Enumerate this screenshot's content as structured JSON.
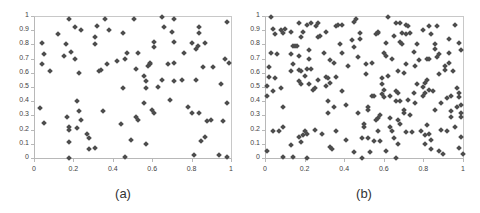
{
  "chart_data": [
    {
      "type": "scatter",
      "title": "",
      "caption": "(a)",
      "xlabel": "",
      "ylabel": "",
      "xlim": [
        0,
        1
      ],
      "ylim": [
        0,
        1
      ],
      "grid": false,
      "legend": null,
      "x_ticks": [
        "0",
        "0.2",
        "0.4",
        "0.6",
        "0.8",
        "1"
      ],
      "y_ticks": [
        "0",
        "0.1",
        "0.2",
        "0.3",
        "0.4",
        "0.5",
        "0.6",
        "0.7",
        "0.8",
        "0.9",
        "1"
      ],
      "marker": {
        "shape": "diamond",
        "color": "#4d4d4d"
      },
      "points": [
        [
          0.04,
          0.81
        ],
        [
          0.05,
          0.73
        ],
        [
          0.04,
          0.66
        ],
        [
          0.08,
          0.61
        ],
        [
          0.03,
          0.35
        ],
        [
          0.05,
          0.25
        ],
        [
          0.12,
          0.87
        ],
        [
          0.15,
          0.72
        ],
        [
          0.16,
          0.8
        ],
        [
          0.18,
          0.98
        ],
        [
          0.19,
          0.75
        ],
        [
          0.21,
          0.7
        ],
        [
          0.21,
          0.92
        ],
        [
          0.23,
          0.6
        ],
        [
          0.24,
          0.9
        ],
        [
          0.17,
          0.29
        ],
        [
          0.18,
          0.22
        ],
        [
          0.18,
          0.2
        ],
        [
          0.18,
          0.11
        ],
        [
          0.18,
          0.0
        ],
        [
          0.22,
          0.4
        ],
        [
          0.23,
          0.33
        ],
        [
          0.22,
          0.21
        ],
        [
          0.24,
          0.27
        ],
        [
          0.27,
          0.17
        ],
        [
          0.28,
          0.14
        ],
        [
          0.28,
          0.06
        ],
        [
          0.31,
          0.07
        ],
        [
          0.31,
          0.85
        ],
        [
          0.31,
          0.8
        ],
        [
          0.32,
          0.93
        ],
        [
          0.33,
          0.61
        ],
        [
          0.34,
          0.62
        ],
        [
          0.36,
          0.98
        ],
        [
          0.35,
          0.33
        ],
        [
          0.38,
          0.9
        ],
        [
          0.37,
          0.66
        ],
        [
          0.42,
          0.68
        ],
        [
          0.45,
          0.88
        ],
        [
          0.45,
          0.49
        ],
        [
          0.46,
          0.7
        ],
        [
          0.47,
          0.74
        ],
        [
          0.44,
          0.24
        ],
        [
          0.46,
          0.01
        ],
        [
          0.49,
          0.13
        ],
        [
          0.51,
          0.98
        ],
        [
          0.52,
          0.63
        ],
        [
          0.53,
          0.74
        ],
        [
          0.52,
          0.29
        ],
        [
          0.53,
          0.27
        ],
        [
          0.56,
          0.58
        ],
        [
          0.57,
          0.54
        ],
        [
          0.57,
          0.49
        ],
        [
          0.56,
          0.39
        ],
        [
          0.57,
          0.1
        ],
        [
          0.58,
          0.65
        ],
        [
          0.59,
          0.66
        ],
        [
          0.59,
          0.67
        ],
        [
          0.61,
          0.82
        ],
        [
          0.61,
          0.78
        ],
        [
          0.6,
          0.34
        ],
        [
          0.61,
          0.32
        ],
        [
          0.63,
          0.5
        ],
        [
          0.65,
          0.99
        ],
        [
          0.66,
          0.92
        ],
        [
          0.65,
          0.55
        ],
        [
          0.68,
          0.66
        ],
        [
          0.69,
          0.41
        ],
        [
          0.7,
          0.89
        ],
        [
          0.71,
          0.98
        ],
        [
          0.71,
          0.82
        ],
        [
          0.71,
          0.67
        ],
        [
          0.71,
          0.54
        ],
        [
          0.75,
          0.55
        ],
        [
          0.76,
          0.74
        ],
        [
          0.78,
          0.36
        ],
        [
          0.8,
          0.32
        ],
        [
          0.8,
          0.81
        ],
        [
          0.81,
          0.02
        ],
        [
          0.82,
          0.55
        ],
        [
          0.82,
          0.77
        ],
        [
          0.83,
          0.79
        ],
        [
          0.84,
          0.92
        ],
        [
          0.84,
          0.88
        ],
        [
          0.84,
          0.32
        ],
        [
          0.85,
          0.12
        ],
        [
          0.86,
          0.64
        ],
        [
          0.87,
          0.81
        ],
        [
          0.87,
          0.15
        ],
        [
          0.88,
          0.26
        ],
        [
          0.9,
          0.27
        ],
        [
          0.91,
          0.64
        ],
        [
          0.94,
          0.02
        ],
        [
          0.95,
          0.52
        ],
        [
          0.96,
          0.26
        ],
        [
          0.97,
          0.7
        ],
        [
          0.98,
          0.96
        ],
        [
          0.98,
          0.39
        ],
        [
          0.98,
          0.01
        ],
        [
          0.99,
          0.67
        ]
      ]
    },
    {
      "type": "scatter",
      "title": "",
      "caption": "(b)",
      "xlabel": "",
      "ylabel": "",
      "xlim": [
        0,
        1
      ],
      "ylim": [
        0,
        1
      ],
      "grid": false,
      "legend": null,
      "x_ticks": [
        "0",
        "0.2",
        "0.4",
        "0.6",
        "0.8",
        "1"
      ],
      "y_ticks": [
        "0",
        "0.1",
        "0.2",
        "0.3",
        "0.4",
        "0.5",
        "0.6",
        "0.7",
        "0.8",
        "0.9",
        "1"
      ],
      "marker": {
        "shape": "diamond",
        "color": "#4d4d4d"
      },
      "points": [
        [
          0.03,
          0.99
        ],
        [
          0.04,
          0.91
        ],
        [
          0.05,
          0.87
        ],
        [
          0.08,
          0.9
        ],
        [
          0.09,
          0.88
        ],
        [
          0.1,
          0.91
        ],
        [
          0.13,
          0.89
        ],
        [
          0.17,
          0.95
        ],
        [
          0.19,
          0.89
        ],
        [
          0.21,
          0.94
        ],
        [
          0.23,
          0.95
        ],
        [
          0.26,
          0.93
        ],
        [
          0.27,
          0.95
        ],
        [
          0.31,
          0.89
        ],
        [
          0.36,
          0.93
        ],
        [
          0.37,
          0.94
        ],
        [
          0.39,
          0.94
        ],
        [
          0.45,
          0.96
        ],
        [
          0.46,
          0.98
        ],
        [
          0.48,
          0.88
        ],
        [
          0.62,
          0.99
        ],
        [
          0.66,
          0.95
        ],
        [
          0.68,
          0.95
        ],
        [
          0.71,
          0.94
        ],
        [
          0.72,
          0.93
        ],
        [
          0.73,
          0.88
        ],
        [
          0.8,
          0.9
        ],
        [
          0.83,
          0.93
        ],
        [
          0.87,
          0.93
        ],
        [
          0.96,
          0.94
        ],
        [
          0.02,
          0.64
        ],
        [
          0.01,
          0.51
        ],
        [
          0.01,
          0.44
        ],
        [
          0.02,
          0.57
        ],
        [
          0.04,
          0.47
        ],
        [
          0.05,
          0.56
        ],
        [
          0.03,
          0.74
        ],
        [
          0.06,
          0.73
        ],
        [
          0.04,
          0.19
        ],
        [
          0.07,
          0.19
        ],
        [
          0.09,
          0.22
        ],
        [
          0.08,
          0.49
        ],
        [
          0.09,
          0.36
        ],
        [
          0.01,
          0.05
        ],
        [
          0.09,
          0.01
        ],
        [
          0.14,
          0.01
        ],
        [
          0.21,
          0.0
        ],
        [
          0.13,
          0.09
        ],
        [
          0.14,
          0.79
        ],
        [
          0.15,
          0.79
        ],
        [
          0.16,
          0.79
        ],
        [
          0.13,
          0.73
        ],
        [
          0.14,
          0.66
        ],
        [
          0.13,
          0.61
        ],
        [
          0.17,
          0.62
        ],
        [
          0.18,
          0.61
        ],
        [
          0.17,
          0.54
        ],
        [
          0.18,
          0.52
        ],
        [
          0.17,
          0.72
        ],
        [
          0.18,
          0.85
        ],
        [
          0.17,
          0.15
        ],
        [
          0.18,
          0.11
        ],
        [
          0.19,
          0.16
        ],
        [
          0.2,
          0.19
        ],
        [
          0.21,
          0.17
        ],
        [
          0.2,
          0.58
        ],
        [
          0.21,
          0.63
        ],
        [
          0.22,
          0.7
        ],
        [
          0.22,
          0.76
        ],
        [
          0.23,
          0.63
        ],
        [
          0.22,
          0.52
        ],
        [
          0.24,
          0.48
        ],
        [
          0.25,
          0.49
        ],
        [
          0.25,
          0.2
        ],
        [
          0.27,
          0.55
        ],
        [
          0.27,
          0.85
        ],
        [
          0.28,
          0.86
        ],
        [
          0.29,
          0.17
        ],
        [
          0.3,
          0.74
        ],
        [
          0.31,
          0.57
        ],
        [
          0.31,
          0.51
        ],
        [
          0.32,
          0.56
        ],
        [
          0.32,
          0.4
        ],
        [
          0.32,
          0.32
        ],
        [
          0.33,
          0.53
        ],
        [
          0.33,
          0.69
        ],
        [
          0.35,
          0.67
        ],
        [
          0.36,
          0.57
        ],
        [
          0.35,
          0.36
        ],
        [
          0.36,
          0.19
        ],
        [
          0.33,
          0.08
        ],
        [
          0.34,
          0.06
        ],
        [
          0.38,
          0.8
        ],
        [
          0.39,
          0.74
        ],
        [
          0.39,
          0.47
        ],
        [
          0.41,
          0.37
        ],
        [
          0.41,
          0.13
        ],
        [
          0.42,
          0.65
        ],
        [
          0.44,
          0.83
        ],
        [
          0.45,
          0.78
        ],
        [
          0.45,
          0.04
        ],
        [
          0.47,
          0.32
        ],
        [
          0.47,
          0.71
        ],
        [
          0.48,
          0.84
        ],
        [
          0.49,
          0.14
        ],
        [
          0.49,
          0.0
        ],
        [
          0.5,
          0.22
        ],
        [
          0.5,
          0.24
        ],
        [
          0.51,
          0.59
        ],
        [
          0.51,
          0.66
        ],
        [
          0.52,
          0.36
        ],
        [
          0.52,
          0.34
        ],
        [
          0.52,
          0.14
        ],
        [
          0.53,
          0.04
        ],
        [
          0.54,
          0.44
        ],
        [
          0.54,
          0.67
        ],
        [
          0.55,
          0.44
        ],
        [
          0.55,
          0.12
        ],
        [
          0.56,
          0.27
        ],
        [
          0.56,
          0.87
        ],
        [
          0.57,
          0.88
        ],
        [
          0.57,
          0.89
        ],
        [
          0.57,
          0.28
        ],
        [
          0.57,
          0.19
        ],
        [
          0.58,
          0.12
        ],
        [
          0.58,
          0.3
        ],
        [
          0.59,
          0.45
        ],
        [
          0.59,
          0.52
        ],
        [
          0.59,
          0.56
        ],
        [
          0.6,
          0.48
        ],
        [
          0.6,
          0.43
        ],
        [
          0.6,
          0.74
        ],
        [
          0.61,
          0.72
        ],
        [
          0.61,
          0.81
        ],
        [
          0.61,
          0.05
        ],
        [
          0.62,
          0.58
        ],
        [
          0.63,
          0.44
        ],
        [
          0.63,
          0.28
        ],
        [
          0.63,
          0.22
        ],
        [
          0.64,
          0.19
        ],
        [
          0.64,
          0.7
        ],
        [
          0.65,
          0.86
        ],
        [
          0.65,
          0.14
        ],
        [
          0.66,
          0.4
        ],
        [
          0.66,
          0.47
        ],
        [
          0.66,
          0.0
        ],
        [
          0.67,
          0.61
        ],
        [
          0.67,
          0.1
        ],
        [
          0.67,
          0.46
        ],
        [
          0.68,
          0.4
        ],
        [
          0.67,
          0.27
        ],
        [
          0.68,
          0.24
        ],
        [
          0.68,
          0.82
        ],
        [
          0.69,
          0.8
        ],
        [
          0.69,
          0.88
        ],
        [
          0.7,
          0.6
        ],
        [
          0.7,
          0.34
        ],
        [
          0.7,
          0.32
        ],
        [
          0.71,
          0.87
        ],
        [
          0.71,
          0.66
        ],
        [
          0.71,
          0.18
        ],
        [
          0.72,
          0.41
        ],
        [
          0.73,
          0.3
        ],
        [
          0.74,
          0.18
        ],
        [
          0.75,
          0.75
        ],
        [
          0.75,
          0.46
        ],
        [
          0.76,
          0.39
        ],
        [
          0.76,
          0.65
        ],
        [
          0.77,
          0.52
        ],
        [
          0.77,
          0.8
        ],
        [
          0.78,
          0.69
        ],
        [
          0.79,
          0.19
        ],
        [
          0.8,
          0.5
        ],
        [
          0.8,
          0.44
        ],
        [
          0.81,
          0.53
        ],
        [
          0.81,
          0.46
        ],
        [
          0.81,
          0.16
        ],
        [
          0.81,
          0.1
        ],
        [
          0.82,
          0.55
        ],
        [
          0.82,
          0.7
        ],
        [
          0.82,
          0.23
        ],
        [
          0.83,
          0.7
        ],
        [
          0.83,
          0.17
        ],
        [
          0.83,
          0.48
        ],
        [
          0.84,
          0.87
        ],
        [
          0.84,
          0.13
        ],
        [
          0.84,
          0.06
        ],
        [
          0.85,
          0.47
        ],
        [
          0.86,
          0.77
        ],
        [
          0.86,
          0.34
        ],
        [
          0.86,
          0.8
        ],
        [
          0.87,
          0.71
        ],
        [
          0.88,
          0.59
        ],
        [
          0.88,
          0.73
        ],
        [
          0.88,
          0.05
        ],
        [
          0.89,
          0.39
        ],
        [
          0.89,
          0.2
        ],
        [
          0.9,
          0.03
        ],
        [
          0.91,
          0.65
        ],
        [
          0.91,
          0.62
        ],
        [
          0.92,
          0.19
        ],
        [
          0.93,
          0.67
        ],
        [
          0.93,
          0.74
        ],
        [
          0.93,
          0.84
        ],
        [
          0.94,
          0.33
        ],
        [
          0.94,
          0.29
        ],
        [
          0.94,
          0.44
        ],
        [
          0.95,
          0.61
        ],
        [
          0.96,
          0.22
        ],
        [
          0.97,
          0.49
        ],
        [
          0.97,
          0.36
        ],
        [
          0.98,
          0.07
        ],
        [
          0.98,
          0.81
        ],
        [
          0.98,
          0.43
        ],
        [
          0.99,
          0.37
        ],
        [
          0.99,
          0.76
        ],
        [
          0.99,
          0.32
        ],
        [
          0.99,
          0.29
        ],
        [
          0.99,
          0.15
        ],
        [
          1.0,
          0.03
        ],
        [
          0.98,
          0.46
        ],
        [
          0.92,
          0.42
        ]
      ]
    }
  ]
}
